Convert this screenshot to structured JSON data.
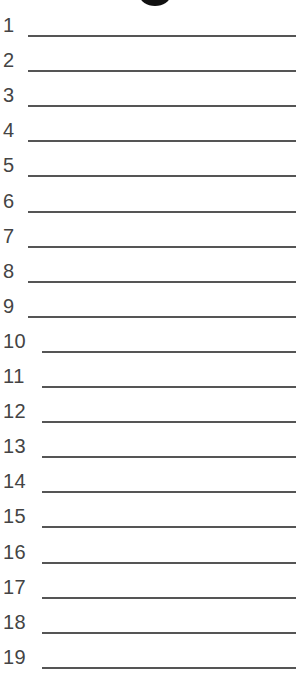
{
  "header": {
    "partial_title_glyph": "g"
  },
  "rows": [
    {
      "number": "1"
    },
    {
      "number": "2"
    },
    {
      "number": "3"
    },
    {
      "number": "4"
    },
    {
      "number": "5"
    },
    {
      "number": "6"
    },
    {
      "number": "7"
    },
    {
      "number": "8"
    },
    {
      "number": "9"
    },
    {
      "number": "10"
    },
    {
      "number": "11"
    },
    {
      "number": "12"
    },
    {
      "number": "13"
    },
    {
      "number": "14"
    },
    {
      "number": "15"
    },
    {
      "number": "16"
    },
    {
      "number": "17"
    },
    {
      "number": "18"
    },
    {
      "number": "19"
    }
  ],
  "colors": {
    "text": "#444444",
    "line": "#555555",
    "background": "#ffffff"
  }
}
